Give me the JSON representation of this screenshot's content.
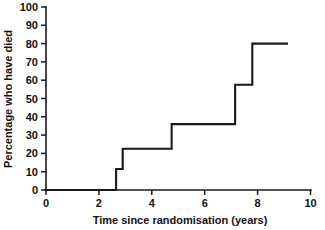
{
  "chart_data": {
    "type": "line",
    "title": "",
    "subtitle": "",
    "xlabel": "Time since randomisation (years)",
    "ylabel": "Percentage who have died",
    "xlim": [
      0,
      10
    ],
    "ylim": [
      0,
      100
    ],
    "xticks": [
      "0",
      "2",
      "4",
      "6",
      "8",
      "10"
    ],
    "xtick_values": [
      0,
      2,
      4,
      6,
      8,
      10
    ],
    "yticks": [
      "0",
      "10",
      "20",
      "30",
      "40",
      "50",
      "60",
      "70",
      "80",
      "90",
      "100"
    ],
    "ytick_values": [
      0,
      10,
      20,
      30,
      40,
      50,
      60,
      70,
      80,
      90,
      100
    ],
    "grid": false,
    "legend": null,
    "curve_style": "step-post",
    "series": [
      {
        "name": "Cumulative mortality",
        "x": [
          0,
          2.65,
          2.65,
          2.9,
          2.9,
          4.75,
          4.75,
          7.15,
          7.15,
          7.8,
          7.8,
          9.15
        ],
        "y": [
          0,
          0,
          11.5,
          11.5,
          22.5,
          22.5,
          36,
          36,
          57.5,
          57.5,
          80,
          80
        ]
      }
    ],
    "steps": [
      {
        "time": 2.65,
        "from": 0,
        "to": 11.5
      },
      {
        "time": 2.9,
        "from": 11.5,
        "to": 22.5
      },
      {
        "time": 4.75,
        "from": 22.5,
        "to": 36
      },
      {
        "time": 7.15,
        "from": 36,
        "to": 57.5
      },
      {
        "time": 7.8,
        "from": 57.5,
        "to": 80
      }
    ],
    "line_color": "#1a1a1a",
    "background_color": "#ffffff"
  }
}
